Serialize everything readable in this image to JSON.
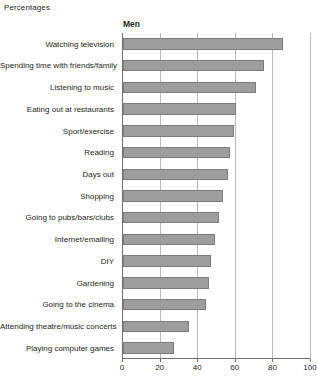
{
  "units_label": "Percentages",
  "series_title": "Men",
  "colors": {
    "bar_fill": "#9d9d9d",
    "bar_border": "#7d7d7d",
    "gridline": "#b9b9b9",
    "axis": "#6f6f6f",
    "text": "#231f20"
  },
  "chart_data": {
    "type": "bar",
    "orientation": "horizontal",
    "title": "Men",
    "subtitle": "",
    "xlabel": "",
    "ylabel": "",
    "unit_note": "Percentages",
    "xlim": [
      0,
      100
    ],
    "xticks": [
      0,
      20,
      40,
      60,
      80,
      100
    ],
    "xticklabels": [
      "0",
      "20",
      "40",
      "60",
      "80",
      "100"
    ],
    "grid": true,
    "legend": "none",
    "categories": [
      "Watching television",
      "Spending time with friends/family",
      "Listening to music",
      "Eating out at restaurants",
      "Sport/exercise",
      "Reading",
      "Days out",
      "Shopping",
      "Going to pubs/bars/clubs",
      "Internet/emailing",
      "DIY",
      "Gardening",
      "Going to the cinema",
      "Attending theatre/music concerts",
      "Playing computer games"
    ],
    "values": [
      85,
      75,
      71,
      60,
      59,
      57,
      56,
      53,
      51,
      49,
      47,
      46,
      44,
      35,
      27
    ],
    "series": [
      {
        "name": "Men",
        "values": [
          85,
          75,
          71,
          60,
          59,
          57,
          56,
          53,
          51,
          49,
          47,
          46,
          44,
          35,
          27
        ]
      }
    ]
  }
}
